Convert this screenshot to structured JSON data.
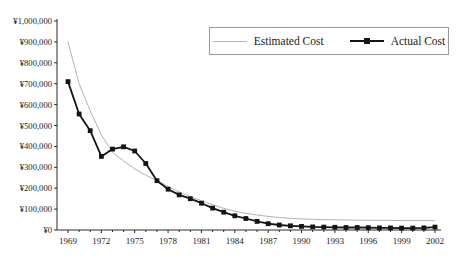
{
  "chart_data": {
    "type": "line",
    "title": "",
    "xlabel": "",
    "ylabel": "",
    "grid": false,
    "legend_position": "top-right",
    "ylim": [
      0,
      1000000
    ],
    "ytick_step": 100000,
    "ytick_labels": [
      "¥0",
      "¥100,000",
      "¥200,000",
      "¥300,000",
      "¥400,000",
      "¥500,000",
      "¥600,000",
      "¥700,000",
      "¥800,000",
      "¥900,000",
      "¥1,000,000"
    ],
    "xtick_label_every": 3,
    "xtick_labels": [
      "1969",
      "1972",
      "1975",
      "1978",
      "1981",
      "1984",
      "1987",
      "1990",
      "1993",
      "1996",
      "1999",
      "2002"
    ],
    "x": [
      1969,
      1970,
      1971,
      1972,
      1973,
      1974,
      1975,
      1976,
      1977,
      1978,
      1979,
      1980,
      1981,
      1982,
      1983,
      1984,
      1985,
      1986,
      1987,
      1988,
      1989,
      1990,
      1991,
      1992,
      1993,
      1994,
      1995,
      1996,
      1997,
      1998,
      1999,
      2000,
      2001,
      2002
    ],
    "series": [
      {
        "name": "Estimated Cost",
        "color": "#b2b2b2",
        "marker": "none",
        "line_width": 1,
        "values": [
          900000,
          700000,
          570000,
          455000,
          372000,
          330000,
          293000,
          262000,
          236000,
          208000,
          182000,
          160000,
          140000,
          121000,
          104000,
          90000,
          80000,
          72000,
          65000,
          60000,
          56000,
          53000,
          51000,
          50000,
          49000,
          48000,
          47000,
          47000,
          46000,
          46000,
          45000,
          45000,
          45000,
          45000
        ]
      },
      {
        "name": "Actual Cost",
        "color": "#141414",
        "marker": "square",
        "line_width": 1.8,
        "values": [
          710000,
          555000,
          475000,
          352000,
          387000,
          398000,
          378000,
          318000,
          236000,
          195000,
          168000,
          150000,
          128000,
          105000,
          85000,
          68000,
          55000,
          41000,
          30000,
          24000,
          20000,
          17000,
          15000,
          14000,
          13000,
          12000,
          12000,
          11000,
          10000,
          10000,
          9000,
          9000,
          10000,
          14000
        ]
      }
    ],
    "axis_color": "#2a2a2a",
    "tick_label_color": "#1a1a1a"
  },
  "legend": {
    "items": [
      {
        "label": "Estimated Cost"
      },
      {
        "label": "Actual Cost"
      }
    ]
  }
}
